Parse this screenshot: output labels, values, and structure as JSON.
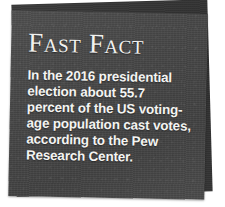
{
  "callout": {
    "kind": "fast-fact-callout",
    "title": "Fast Fact",
    "body_lines": [
      "In the 2016 presidential",
      "election about 55.7",
      "percent of the US voting-",
      "age population cast votes,",
      "according to the Pew",
      "Research Center."
    ],
    "body_text": "In the 2016 presidential election about 55.7 percent of the US voting-age population cast votes, according to the Pew Research Center.",
    "facts": {
      "year": "2016",
      "event": "presidential election",
      "turnout_percent": "55.7",
      "population_measure": "US voting-age population",
      "source": "Pew Research Center"
    },
    "colors": {
      "card_front": "#464646",
      "card_back": "#333333",
      "text": "#f4f4f2",
      "page_background": "#ffffff"
    }
  }
}
